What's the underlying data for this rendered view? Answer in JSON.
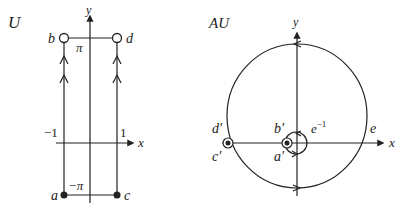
{
  "left_panel": {
    "title": "U",
    "axis_x_label": "x",
    "axis_y_label": "y",
    "tick_left": "−1",
    "tick_right": "1",
    "top_value": "π",
    "bottom_value": "−π",
    "points": {
      "a": "a",
      "b": "b",
      "c": "c",
      "d": "d"
    }
  },
  "right_panel": {
    "title": "AU",
    "axis_x_label": "x",
    "axis_y_label": "y",
    "inner_radius_label": "e−1",
    "inner_radius_base": "e",
    "inner_radius_exp": "−1",
    "outer_point": "e",
    "points": {
      "a": "a′",
      "b": "b′",
      "c": "c′",
      "d": "d′"
    }
  },
  "colors": {
    "stroke": "#222222",
    "background": "#ffffff"
  }
}
